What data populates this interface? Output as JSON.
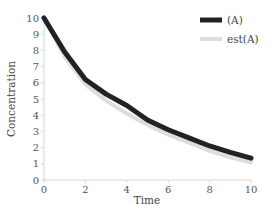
{
  "chart_data": {
    "type": "line",
    "title": "",
    "xlabel": "Time",
    "ylabel": "Concentration",
    "xlim": [
      0,
      10
    ],
    "ylim": [
      0,
      10
    ],
    "x_ticks": [
      "0",
      "2",
      "4",
      "6",
      "8",
      "10"
    ],
    "y_ticks": [
      "0",
      "1",
      "2",
      "3",
      "4",
      "5",
      "6",
      "7",
      "8",
      "9",
      "10"
    ],
    "grid": false,
    "legend_position": "top-right",
    "x": [
      0,
      1,
      2,
      3,
      4,
      5,
      6,
      7,
      8,
      9,
      10
    ],
    "series": [
      {
        "name": "(A)",
        "color": "#222222",
        "values": [
          10,
          7.9,
          6.2,
          5.3,
          4.6,
          3.7,
          3.1,
          2.6,
          2.1,
          1.7,
          1.35
        ]
      },
      {
        "name": "est(A)",
        "color": "#dddddd",
        "values": [
          10,
          7.6,
          5.9,
          4.9,
          4.1,
          3.4,
          2.8,
          2.3,
          1.8,
          1.4,
          1.1
        ]
      }
    ]
  }
}
